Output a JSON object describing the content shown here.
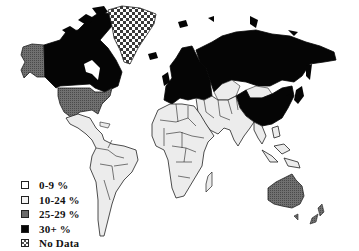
{
  "map": {
    "type": "choropleth world map",
    "categories": {
      "c0_9": {
        "label": "0-9 %",
        "fill": "#ffffff"
      },
      "c10_24": {
        "label": "10-24 %",
        "fill": "#ececec"
      },
      "c25_29": {
        "label": "25-29 %",
        "fill": "#6a6a6a"
      },
      "c30": {
        "label": "30+ %",
        "fill": "#050505"
      },
      "nodata": {
        "label": "No Data",
        "fill": "checker"
      }
    },
    "regions": [
      {
        "name": "Alaska",
        "category": "25-29 %"
      },
      {
        "name": "Canada",
        "category": "30+ %"
      },
      {
        "name": "United States",
        "category": "25-29 %"
      },
      {
        "name": "Greenland",
        "category": "No Data"
      },
      {
        "name": "Latin America",
        "category": "10-24 %"
      },
      {
        "name": "Europe",
        "category": "30+ %"
      },
      {
        "name": "Russia / North Asia",
        "category": "30+ %"
      },
      {
        "name": "Central Asia",
        "category": "10-24 %"
      },
      {
        "name": "Mongolia",
        "category": "10-24 %"
      },
      {
        "name": "China / East Asia",
        "category": "30+ %"
      },
      {
        "name": "Japan",
        "category": "30+ %"
      },
      {
        "name": "Africa",
        "category": "10-24 %"
      },
      {
        "name": "Middle East",
        "category": "10-24 %"
      },
      {
        "name": "South Asia",
        "category": "10-24 %"
      },
      {
        "name": "Southeast Asia",
        "category": "10-24 %"
      },
      {
        "name": "Australia",
        "category": "25-29 %"
      },
      {
        "name": "New Zealand",
        "category": "25-29 %"
      }
    ]
  },
  "legend": {
    "items": [
      {
        "label": "0-9 %",
        "fill": "#ffffff"
      },
      {
        "label": "10-24 %",
        "fill": "#ececec"
      },
      {
        "label": "25-29 %",
        "fill": "#6a6a6a"
      },
      {
        "label": "30+ %",
        "fill": "#050505"
      },
      {
        "label": "No Data",
        "fill": "checker"
      }
    ]
  }
}
